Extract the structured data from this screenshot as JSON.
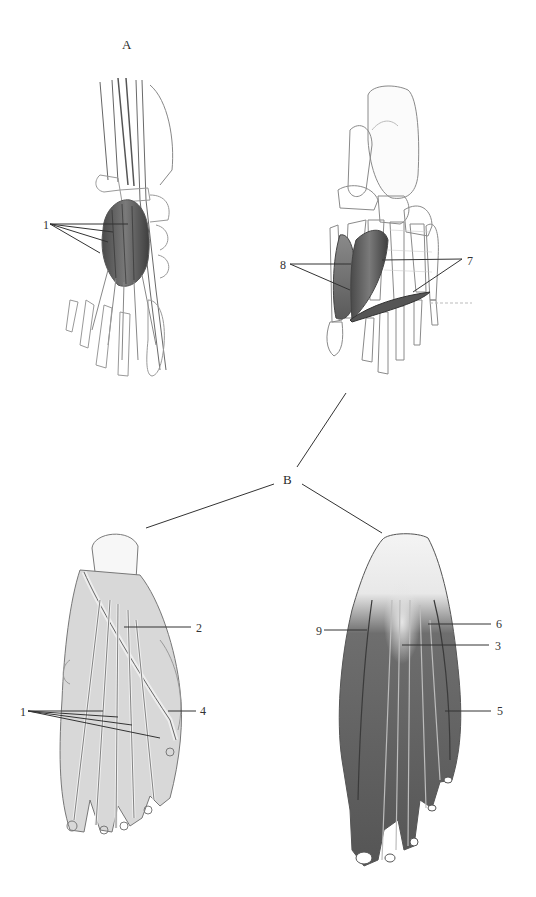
{
  "figure": {
    "background": "#ffffff",
    "ink_color": "#333333",
    "section_labels": [
      {
        "id": "A",
        "text": "A",
        "x": 122,
        "y": 38
      },
      {
        "id": "B",
        "text": "B",
        "x": 283,
        "y": 473
      }
    ],
    "panels": [
      {
        "name": "dorsal-foot-top-left",
        "section": "A",
        "labels": [
          "1"
        ]
      },
      {
        "name": "plantar-foot-top-right",
        "section": "A",
        "labels": [
          "8",
          "7"
        ]
      },
      {
        "name": "plantar-foot-bottom-left",
        "section": "B",
        "labels": [
          "1",
          "2",
          "4"
        ]
      },
      {
        "name": "plantar-foot-bottom-right",
        "section": "B",
        "labels": [
          "9",
          "6",
          "3",
          "5"
        ]
      }
    ],
    "number_labels": [
      {
        "id": "tl-1",
        "text": "1",
        "x": 43,
        "y": 219
      },
      {
        "id": "tr-8",
        "text": "8",
        "x": 280,
        "y": 259
      },
      {
        "id": "tr-7",
        "text": "7",
        "x": 467,
        "y": 255
      },
      {
        "id": "bl-2",
        "text": "2",
        "x": 196,
        "y": 622
      },
      {
        "id": "bl-1",
        "text": "1",
        "x": 20,
        "y": 706
      },
      {
        "id": "bl-4",
        "text": "4",
        "x": 200,
        "y": 705
      },
      {
        "id": "br-6",
        "text": "6",
        "x": 496,
        "y": 618
      },
      {
        "id": "br-9",
        "text": "9",
        "x": 316,
        "y": 625
      },
      {
        "id": "br-3",
        "text": "3",
        "x": 495,
        "y": 640
      },
      {
        "id": "br-5",
        "text": "5",
        "x": 497,
        "y": 705
      }
    ],
    "leader_lines": [
      {
        "from": [
          50,
          224
        ],
        "to": [
          128,
          224
        ]
      },
      {
        "from": [
          50,
          224
        ],
        "to": [
          113,
          232
        ]
      },
      {
        "from": [
          50,
          224
        ],
        "to": [
          108,
          242
        ]
      },
      {
        "from": [
          50,
          224
        ],
        "to": [
          100,
          253
        ]
      },
      {
        "from": [
          290,
          264
        ],
        "to": [
          351,
          264
        ]
      },
      {
        "from": [
          290,
          264
        ],
        "to": [
          350,
          290
        ]
      },
      {
        "from": [
          462,
          259
        ],
        "to": [
          382,
          260
        ]
      },
      {
        "from": [
          462,
          259
        ],
        "to": [
          413,
          292
        ]
      },
      {
        "from": [
          191,
          627
        ],
        "to": [
          124,
          627
        ]
      },
      {
        "from": [
          28,
          711
        ],
        "to": [
          103,
          711
        ]
      },
      {
        "from": [
          28,
          711
        ],
        "to": [
          118,
          717
        ]
      },
      {
        "from": [
          28,
          711
        ],
        "to": [
          132,
          725
        ]
      },
      {
        "from": [
          28,
          711
        ],
        "to": [
          160,
          738
        ]
      },
      {
        "from": [
          196,
          711
        ],
        "to": [
          168,
          711
        ]
      },
      {
        "from": [
          491,
          624
        ],
        "to": [
          428,
          624
        ]
      },
      {
        "from": [
          324,
          630
        ],
        "to": [
          367,
          630
        ]
      },
      {
        "from": [
          489,
          645
        ],
        "to": [
          402,
          645
        ]
      },
      {
        "from": [
          491,
          711
        ],
        "to": [
          445,
          711
        ]
      },
      {
        "from": [
          346,
          393
        ],
        "to": [
          297,
          467
        ]
      },
      {
        "from": [
          274,
          484
        ],
        "to": [
          146,
          528
        ]
      },
      {
        "from": [
          302,
          484
        ],
        "to": [
          382,
          533
        ]
      }
    ]
  }
}
